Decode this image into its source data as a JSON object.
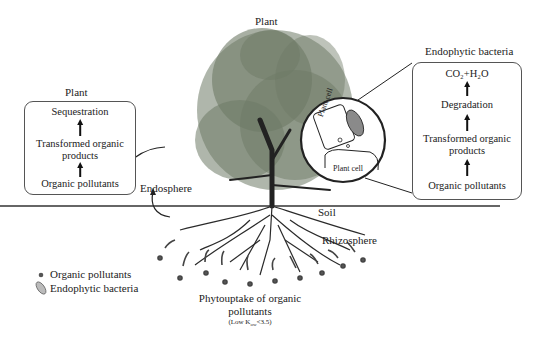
{
  "title": "Plant",
  "left_panel": {
    "heading": "Plant",
    "steps": [
      "Sequestration",
      "Transformed organic products",
      "Organic pollutants"
    ]
  },
  "right_panel": {
    "heading": "Endophytic bacteria",
    "steps": [
      "CO₂+H₂O",
      "Degradation",
      "Transformed organic products",
      "Organic pollutants"
    ]
  },
  "inset": {
    "upper_cell_label": "Plant cell",
    "lower_cell_label": "Plant cell"
  },
  "labels": {
    "endosphere": "Endosphere",
    "soil": "Soil",
    "rhizosphere": "Rhizosphere",
    "phytouptake_line1": "Phytouptake of organic",
    "phytouptake_line2": "pollutants",
    "condition": "(Low K",
    "condition_sub": "ow",
    "condition_end": "<3.5)"
  },
  "legend": {
    "items": [
      {
        "icon": "dot-icon",
        "label": "Organic pollutants"
      },
      {
        "icon": "bacterium-icon",
        "label": "Endophytic bacteria"
      }
    ]
  },
  "colors": {
    "foliage": "#6e7a66",
    "roots": "#2a2a2a",
    "pollutant_dot": "#555555",
    "bacterium": "#8a8a8a"
  }
}
